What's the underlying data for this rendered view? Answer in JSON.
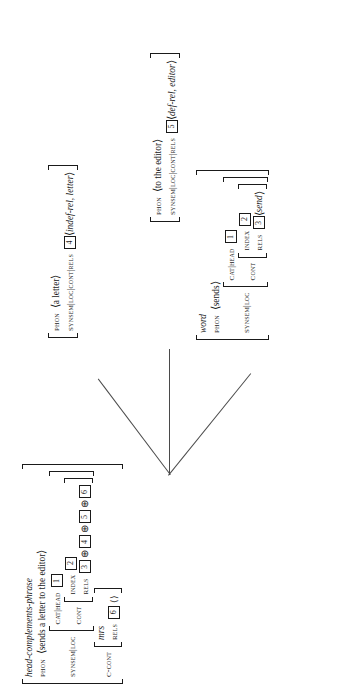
{
  "figure": {
    "kind": "hpsg-avm-tree",
    "orientation": "rotated-90-ccw",
    "root": {
      "type_label": "head-complements-phrase",
      "phon_attr": "PHON",
      "phon_value": "sends a letter to the editor",
      "synsem_attr": "SYNSEM|LOC",
      "cat_attr": "CAT|HEAD",
      "cat_tag": "1",
      "cont_attr": "CONT",
      "index_attr": "INDEX",
      "index_tag": "2",
      "rels_attr": "RELS",
      "rels_tags": [
        "3",
        "4",
        "5",
        "6"
      ],
      "rels_op": "⊕",
      "ccont_attr": "C-CONT",
      "ccont_type": "mrs",
      "ccont_rels_attr": "RELS",
      "ccont_rels_tag": "6",
      "ccont_rels_value": "⟨⟩"
    },
    "daughters": [
      {
        "id": "dtr-sends",
        "type_label": "word",
        "phon_attr": "PHON",
        "phon_value": "sends",
        "synsem_attr": "SYNSEM|LOC",
        "cat_attr": "CAT|HEAD",
        "cat_tag": "1",
        "cont_attr": "CONT",
        "index_attr": "INDEX",
        "index_tag": "2",
        "rels_attr": "RELS",
        "rels_tag": "3",
        "rels_value": "send"
      },
      {
        "id": "dtr-a-letter",
        "type_label": "",
        "phon_attr": "PHON",
        "phon_value": "a letter",
        "synsem_attr": "SYNSEM|LOC|CONT|RELS",
        "rels_tag": "4",
        "rels_value": "indef-rel, letter"
      },
      {
        "id": "dtr-to-the-editor",
        "type_label": "",
        "phon_attr": "PHON",
        "phon_value": "to the editor",
        "synsem_attr": "SYNSEM|LOC|CONT|RELS",
        "rels_tag": "5",
        "rels_value": "def-rel, editor"
      }
    ],
    "brackets": {
      "angle_open": "⟨",
      "angle_close": "⟩"
    }
  }
}
